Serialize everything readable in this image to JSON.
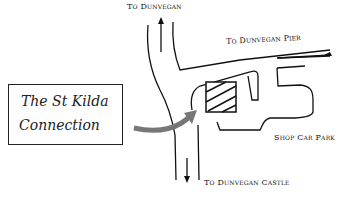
{
  "map": {
    "labels": {
      "north": "To Dunvegan",
      "pier": "To Dunvegan Pier",
      "car_park": "Shop Car Park",
      "castle": "To Dunvegan Castle"
    },
    "sign": {
      "line1": "The St Kilda",
      "line2": "Connection"
    },
    "colors": {
      "ink": "#111111",
      "arrow": "#777777",
      "background": "#ffffff"
    }
  }
}
